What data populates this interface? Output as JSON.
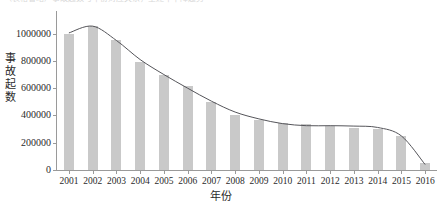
{
  "top_caption": "（表格省略）事故起数与年份对应关系，呈逐年下降趋势",
  "colors": {
    "bar_fill": "#c9c9c9",
    "trend_line": "#55555a",
    "axis": "#9a9a9a",
    "text": "#2b2b2b"
  },
  "chart_data": {
    "type": "bar",
    "title": "",
    "subtitle": "",
    "xlabel": "年份",
    "ylabel": "事故起数",
    "categories": [
      "2001",
      "2002",
      "2003",
      "2004",
      "2005",
      "2006",
      "2007",
      "2008",
      "2009",
      "2010",
      "2011",
      "2012",
      "2013",
      "2014",
      "2015",
      "2016"
    ],
    "values": [
      1000000,
      1055000,
      950000,
      790000,
      700000,
      615000,
      500000,
      405000,
      370000,
      348000,
      340000,
      325000,
      305000,
      300000,
      250000,
      50000
    ],
    "series": [
      {
        "name": "事故起数",
        "type": "bar",
        "values": [
          1000000,
          1055000,
          950000,
          790000,
          700000,
          615000,
          500000,
          405000,
          370000,
          348000,
          340000,
          325000,
          305000,
          300000,
          250000,
          50000
        ]
      },
      {
        "name": "趋势线",
        "type": "line",
        "values": [
          1005000,
          1055000,
          950000,
          810000,
          700000,
          600000,
          505000,
          425000,
          375000,
          340000,
          325000,
          325000,
          322000,
          312000,
          250000,
          40000
        ]
      }
    ],
    "ylim": [
      0,
      1100000
    ],
    "ytick_values": [
      0,
      200000,
      400000,
      600000,
      800000,
      1000000
    ],
    "ytick_labels": [
      "0",
      "200000",
      "400000",
      "600000",
      "800000",
      "1000000"
    ],
    "grid": false,
    "legend": false,
    "legend_position": "none",
    "annotations": []
  }
}
